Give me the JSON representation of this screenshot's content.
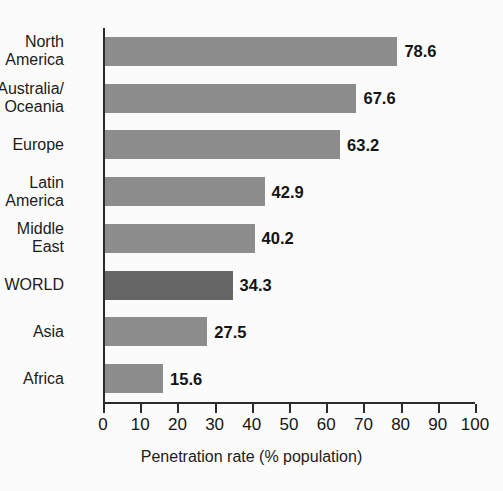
{
  "chart_data": {
    "type": "bar",
    "orientation": "horizontal",
    "title": "",
    "xlabel": "Penetration rate (% population)",
    "ylabel": "",
    "xlim": [
      0,
      100
    ],
    "xticks": [
      0,
      10,
      20,
      30,
      40,
      50,
      60,
      70,
      80,
      90,
      100
    ],
    "grid": false,
    "legend": false,
    "categories": [
      "North\nAmerica",
      "Australia/\nOceania",
      "Europe",
      "Latin\nAmerica",
      "Middle\nEast",
      "WORLD",
      "Asia",
      "Africa"
    ],
    "values": [
      78.6,
      67.6,
      63.2,
      42.9,
      40.2,
      34.3,
      27.5,
      15.6
    ],
    "value_labels": [
      "78.6",
      "67.6",
      "63.2",
      "42.9",
      "40.2",
      "34.3",
      "27.5",
      "15.6"
    ],
    "highlight_index": 5,
    "colors": {
      "bar": "#8d8d8d",
      "bar_highlight": "#666666",
      "axis": "#2b2b2b",
      "text": "#1c1c1c",
      "background": "#fbfbfb"
    }
  }
}
